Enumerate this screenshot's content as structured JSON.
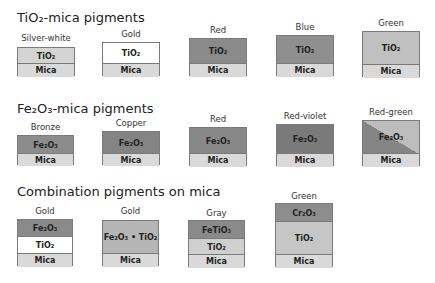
{
  "sections": [
    {
      "title": "TiO₂-mica pigments",
      "top": 10
    },
    {
      "title": "Fe₂O₃-mica pigments",
      "top": 101
    },
    {
      "title": "Combination pigments on mica",
      "top": 184
    }
  ],
  "colors": {
    "mica": "#d9d9d9",
    "tio2_silver": "#d4d4d4",
    "tio2_gold": "#ffffff",
    "tio2_red": "#8a8a8a",
    "tio2_blue": "#8f8f8f",
    "tio2_green": "#c0c0c0",
    "fe2o3_bronze": "#8c8c8c",
    "fe2o3_copper": "#848484",
    "fe2o3_red": "#888888",
    "fe2o3_redviolet": "#7a7a7a",
    "fe2o3_redgreen_dark": "#858585",
    "fe2o3_redgreen_light": "#bdbdbd",
    "combo_fe2o3": "#8a8a8a",
    "combo_tio2_white": "#ffffff",
    "combo_mixed": "#b5b5b5",
    "combo_fetio3": "#8a8a8a",
    "combo_tio2_light": "#cfcfcf",
    "combo_cr2o3": "#8d8d8d",
    "combo_tio2_green": "#c6c6c6"
  },
  "pigments": [
    {
      "label": "Silver-white",
      "x": 17,
      "w": 58,
      "label_y": 33,
      "layers": [
        {
          "name": "TiO₂",
          "top": 47,
          "h": 16,
          "color": "#d4d4d4"
        },
        {
          "name": "Mica",
          "top": 63,
          "h": 13,
          "color": "#d9d9d9"
        }
      ]
    },
    {
      "label": "Gold",
      "x": 102,
      "w": 58,
      "label_y": 29,
      "layers": [
        {
          "name": "TiO₂",
          "top": 42,
          "h": 21,
          "color": "#ffffff"
        },
        {
          "name": "Mica",
          "top": 63,
          "h": 13,
          "color": "#d9d9d9"
        }
      ]
    },
    {
      "label": "Red",
      "x": 189,
      "w": 58,
      "label_y": 25,
      "layers": [
        {
          "name": "TiO₂",
          "top": 38,
          "h": 25,
          "color": "#8a8a8a"
        },
        {
          "name": "Mica",
          "top": 63,
          "h": 13,
          "color": "#d9d9d9"
        }
      ]
    },
    {
      "label": "Blue",
      "x": 276,
      "w": 58,
      "label_y": 22,
      "layers": [
        {
          "name": "TiO₂",
          "top": 35,
          "h": 28,
          "color": "#8f8f8f"
        },
        {
          "name": "Mica",
          "top": 63,
          "h": 13,
          "color": "#d9d9d9"
        }
      ]
    },
    {
      "label": "Green",
      "x": 362,
      "w": 58,
      "label_y": 18,
      "layers": [
        {
          "name": "TiO₂",
          "top": 31,
          "h": 33,
          "color": "#c0c0c0"
        },
        {
          "name": "Mica",
          "top": 64,
          "h": 13,
          "color": "#d9d9d9"
        }
      ]
    },
    {
      "label": "Bronze",
      "x": 17,
      "w": 57,
      "label_y": 122,
      "layers": [
        {
          "name": "Fe₂O₃",
          "top": 135,
          "h": 18,
          "color": "#8c8c8c"
        },
        {
          "name": "Mica",
          "top": 153,
          "h": 12,
          "color": "#d9d9d9"
        }
      ]
    },
    {
      "label": "Copper",
      "x": 102,
      "w": 58,
      "label_y": 118,
      "layers": [
        {
          "name": "Fe₂O₃",
          "top": 131,
          "h": 22,
          "color": "#848484"
        },
        {
          "name": "Mica",
          "top": 153,
          "h": 12,
          "color": "#d9d9d9"
        }
      ]
    },
    {
      "label": "Red",
      "x": 189,
      "w": 58,
      "label_y": 114,
      "layers": [
        {
          "name": "Fe₂O₃",
          "top": 127,
          "h": 26,
          "color": "#888888"
        },
        {
          "name": "Mica",
          "top": 153,
          "h": 13,
          "color": "#d9d9d9"
        }
      ]
    },
    {
      "label": "Red-violet",
      "x": 276,
      "w": 58,
      "label_y": 111,
      "layers": [
        {
          "name": "Fe₂O₃",
          "top": 124,
          "h": 29,
          "color": "#7a7a7a"
        },
        {
          "name": "Mica",
          "top": 153,
          "h": 13,
          "color": "#d9d9d9"
        }
      ]
    },
    {
      "label": "Red-green",
      "x": 362,
      "w": 58,
      "label_y": 107,
      "layers": [
        {
          "name": "Fe₂O₃",
          "top": 120,
          "h": 33,
          "color": "#858585",
          "diagonal": "#bdbdbd"
        },
        {
          "name": "Mica",
          "top": 153,
          "h": 13,
          "color": "#d9d9d9"
        }
      ]
    },
    {
      "label": "Gold",
      "x": 17,
      "w": 56,
      "label_y": 206,
      "layers": [
        {
          "name": "Fe₂O₃",
          "top": 219,
          "h": 17,
          "color": "#8a8a8a"
        },
        {
          "name": "TiO₂",
          "top": 236,
          "h": 17,
          "color": "#ffffff"
        },
        {
          "name": "Mica",
          "top": 253,
          "h": 13,
          "color": "#d9d9d9"
        }
      ]
    },
    {
      "label": "Gold",
      "x": 102,
      "w": 57,
      "label_y": 206,
      "layers": [
        {
          "name": "Fe₂O₃ • TiO₂",
          "top": 220,
          "h": 33,
          "color": "#b5b5b5"
        },
        {
          "name": "Mica",
          "top": 253,
          "h": 13,
          "color": "#d9d9d9"
        }
      ]
    },
    {
      "label": "Gray",
      "x": 188,
      "w": 57,
      "label_y": 208,
      "layers": [
        {
          "name": "FeTiO₃",
          "top": 220,
          "h": 18,
          "color": "#8a8a8a"
        },
        {
          "name": "TiO₂",
          "top": 238,
          "h": 16,
          "color": "#cfcfcf"
        },
        {
          "name": "Mica",
          "top": 254,
          "h": 13,
          "color": "#d9d9d9"
        }
      ]
    },
    {
      "label": "Green",
      "x": 275,
      "w": 58,
      "label_y": 191,
      "layers": [
        {
          "name": "Cr₂O₃",
          "top": 203,
          "h": 18,
          "color": "#8d8d8d"
        },
        {
          "name": "TiO₂",
          "top": 221,
          "h": 33,
          "color": "#c6c6c6"
        },
        {
          "name": "Mica",
          "top": 254,
          "h": 13,
          "color": "#d9d9d9"
        }
      ]
    }
  ]
}
